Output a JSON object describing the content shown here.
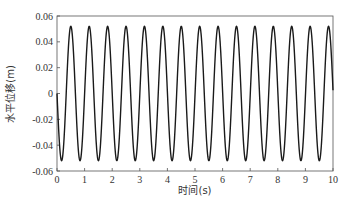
{
  "chart_data": {
    "type": "line",
    "title": "",
    "xlabel": "时间(s)",
    "ylabel": "水平位移(m)",
    "xlim": [
      0,
      10
    ],
    "ylim": [
      -0.06,
      0.06
    ],
    "xticks": [
      "0",
      "1",
      "2",
      "3",
      "4",
      "5",
      "6",
      "7",
      "8",
      "9",
      "10"
    ],
    "yticks": [
      "0.06",
      "0.04",
      "0.02",
      "0",
      "-0.02",
      "-0.04",
      "-0.06"
    ],
    "grid": false,
    "legend": null,
    "series": [
      {
        "name": "水平位移",
        "color": "#1a1a1a",
        "description": "sinusoidal oscillation, amplitude ≈0.052 m, period ≈0.667 s (~15 cycles over 10 s), starting at 0 and dipping first",
        "amplitude": 0.052,
        "period": 0.667,
        "x": [
          0,
          0.17,
          0.33,
          0.5,
          0.67,
          0.83,
          1.0,
          1.17,
          1.33,
          1.5,
          1.67,
          1.83,
          2.0,
          2.5,
          3.0,
          3.5,
          4.0,
          4.5,
          5.0,
          5.5,
          6.0,
          6.5,
          7.0,
          7.5,
          8.0,
          8.5,
          9.0,
          9.5,
          10.0
        ],
        "y": [
          0,
          -0.052,
          0,
          0.052,
          0,
          -0.052,
          0,
          0.052,
          0,
          -0.052,
          0,
          0.052,
          0,
          0.052,
          0,
          -0.052,
          0,
          0.052,
          0,
          0.052,
          0,
          -0.052,
          0,
          0.052,
          0,
          0.052,
          0,
          -0.052,
          0
        ]
      }
    ]
  },
  "caption": ""
}
